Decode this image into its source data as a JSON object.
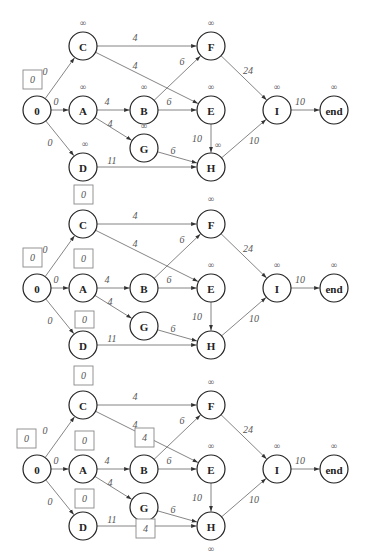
{
  "diagram": {
    "node_radius": 14,
    "infinity_symbol": "∞",
    "nodes": [
      {
        "id": "0",
        "label": "0",
        "x": 37,
        "y": 110
      },
      {
        "id": "C",
        "label": "C",
        "x": 83,
        "y": 46
      },
      {
        "id": "A",
        "label": "A",
        "x": 83,
        "y": 110
      },
      {
        "id": "D",
        "label": "D",
        "x": 83,
        "y": 167
      },
      {
        "id": "B",
        "label": "B",
        "x": 144,
        "y": 110
      },
      {
        "id": "G",
        "label": "G",
        "x": 144,
        "y": 148
      },
      {
        "id": "F",
        "label": "F",
        "x": 211,
        "y": 46
      },
      {
        "id": "E",
        "label": "E",
        "x": 211,
        "y": 110
      },
      {
        "id": "H",
        "label": "H",
        "x": 211,
        "y": 167
      },
      {
        "id": "I",
        "label": "I",
        "x": 277,
        "y": 110
      },
      {
        "id": "end",
        "label": "end",
        "x": 334,
        "y": 110
      }
    ],
    "edges": [
      {
        "from": "0",
        "to": "C",
        "weight": "0",
        "lx": 45,
        "ly": 75
      },
      {
        "from": "0",
        "to": "A",
        "weight": "0",
        "lx": 56,
        "ly": 105
      },
      {
        "from": "0",
        "to": "D",
        "weight": "0",
        "lx": 50,
        "ly": 146
      },
      {
        "from": "C",
        "to": "F",
        "weight": "4",
        "lx": 135,
        "ly": 41
      },
      {
        "from": "C",
        "to": "E",
        "weight": "4",
        "lx": 135,
        "ly": 69
      },
      {
        "from": "A",
        "to": "B",
        "weight": "4",
        "lx": 107,
        "ly": 105
      },
      {
        "from": "A",
        "to": "G",
        "weight": "4",
        "lx": 110,
        "ly": 127
      },
      {
        "from": "B",
        "to": "F",
        "weight": "6",
        "lx": 182,
        "ly": 65
      },
      {
        "from": "B",
        "to": "E",
        "weight": "6",
        "lx": 169,
        "ly": 105
      },
      {
        "from": "G",
        "to": "H",
        "weight": "6",
        "lx": 173,
        "ly": 154
      },
      {
        "from": "D",
        "to": "H",
        "weight": "11",
        "lx": 112,
        "ly": 164
      },
      {
        "from": "E",
        "to": "H",
        "weight": "10",
        "lx": 197,
        "ly": 142
      },
      {
        "from": "F",
        "to": "I",
        "weight": "24",
        "lx": 248,
        "ly": 74
      },
      {
        "from": "H",
        "to": "I",
        "weight": "10",
        "lx": 254,
        "ly": 144
      },
      {
        "from": "I",
        "to": "end",
        "weight": "10",
        "lx": 300,
        "ly": 105
      }
    ],
    "panels": [
      {
        "name": "step-1",
        "offset_y": 0,
        "infinity_labels": [
          {
            "node": "C",
            "x": 83,
            "y": 26
          },
          {
            "node": "A",
            "x": 83,
            "y": 90
          },
          {
            "node": "D",
            "x": 85,
            "y": 147
          },
          {
            "node": "B",
            "x": 144,
            "y": 90
          },
          {
            "node": "G",
            "x": 144,
            "y": 129
          },
          {
            "node": "F",
            "x": 211,
            "y": 26
          },
          {
            "node": "E",
            "x": 211,
            "y": 90
          },
          {
            "node": "H",
            "x": 218,
            "y": 148
          },
          {
            "node": "I",
            "x": 277,
            "y": 90
          },
          {
            "node": "end",
            "x": 334,
            "y": 90
          }
        ],
        "boxes": [
          {
            "node": "0",
            "value": "0",
            "x": 23,
            "y": 70,
            "w": 19,
            "h": 19
          }
        ]
      },
      {
        "name": "step-2",
        "offset_y": 178,
        "infinity_labels": [
          {
            "node": "F",
            "x": 211,
            "y": 24
          },
          {
            "node": "E",
            "x": 211,
            "y": 90
          },
          {
            "node": "I",
            "x": 277,
            "y": 90
          },
          {
            "node": "end",
            "x": 334,
            "y": 90
          }
        ],
        "boxes": [
          {
            "node": "0",
            "value": "0",
            "x": 23,
            "y": 70,
            "w": 19,
            "h": 19
          },
          {
            "node": "C",
            "value": "0",
            "x": 74,
            "y": 7,
            "w": 19,
            "h": 19
          },
          {
            "node": "A",
            "value": "0",
            "x": 74,
            "y": 71,
            "w": 19,
            "h": 19
          },
          {
            "node": "D",
            "value": "0",
            "x": 75,
            "y": 133,
            "w": 19,
            "h": 17
          }
        ]
      },
      {
        "name": "step-3",
        "offset_y": 359,
        "infinity_labels": [
          {
            "node": "F",
            "x": 211,
            "y": 26
          },
          {
            "node": "E",
            "x": 211,
            "y": 90
          },
          {
            "node": "H",
            "x": 211,
            "y": 193
          },
          {
            "node": "I",
            "x": 277,
            "y": 90
          },
          {
            "node": "end",
            "x": 334,
            "y": 90
          }
        ],
        "boxes": [
          {
            "node": "0",
            "value": "0",
            "x": 17,
            "y": 70,
            "w": 19,
            "h": 19
          },
          {
            "node": "C",
            "value": "0",
            "x": 74,
            "y": 7,
            "w": 19,
            "h": 19
          },
          {
            "node": "A",
            "value": "0",
            "x": 75,
            "y": 72,
            "w": 19,
            "h": 19
          },
          {
            "node": "D",
            "value": "0",
            "x": 75,
            "y": 130,
            "w": 19,
            "h": 19
          },
          {
            "node": "B",
            "value": "4",
            "x": 135,
            "y": 69,
            "w": 19,
            "h": 19
          },
          {
            "node": "G",
            "value": "4",
            "x": 136,
            "y": 160,
            "w": 19,
            "h": 19
          }
        ]
      }
    ]
  }
}
